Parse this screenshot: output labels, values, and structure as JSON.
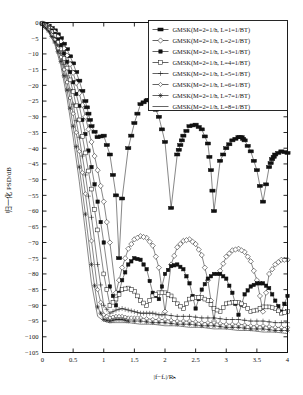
{
  "chart_data": {
    "type": "line",
    "title": "",
    "xlabel": "|f−f_c|/R_b",
    "ylabel": "归一化 PSD/dB",
    "xlim": [
      0,
      4
    ],
    "ylim": [
      -105,
      0
    ],
    "xticks": [
      "0",
      "0.5",
      "1",
      "1.5",
      "2",
      "2.5",
      "3",
      "3.5",
      "4"
    ],
    "xtick_values": [
      0,
      0.5,
      1,
      1.5,
      2,
      2.5,
      3,
      3.5,
      4
    ],
    "yticks": [
      "0",
      "−5",
      "−10",
      "−15",
      "−20",
      "−25",
      "−30",
      "−35",
      "−40",
      "−45",
      "−50",
      "−55",
      "−60",
      "−65",
      "−70",
      "−75",
      "−80",
      "−85",
      "−90",
      "−95",
      "−100",
      "−105"
    ],
    "ytick_values": [
      0,
      -5,
      -10,
      -15,
      -20,
      -25,
      -30,
      -35,
      -40,
      -45,
      -50,
      -55,
      -60,
      -65,
      -70,
      -75,
      -80,
      -85,
      -90,
      -95,
      -100,
      -105
    ],
    "grid": false,
    "legend_position": "top-right",
    "series": [
      {
        "name": "GMSK(M=2=1/h, L=1=1/BT)",
        "marker": "thick-bar",
        "x": [
          0,
          0.1,
          0.2,
          0.3,
          0.4,
          0.5,
          0.6,
          0.7,
          0.75,
          0.8,
          0.9,
          1.0,
          1.1,
          1.2,
          1.25,
          1.3,
          1.4,
          1.5,
          1.6,
          1.7,
          1.75,
          1.8,
          1.9,
          2.0,
          2.1,
          2.2,
          2.25,
          2.3,
          2.4,
          2.5,
          2.6,
          2.7,
          2.75,
          2.8,
          2.9,
          3.0,
          3.1,
          3.2,
          3.25,
          3.3,
          3.4,
          3.5,
          3.6,
          3.7,
          3.75,
          3.8,
          3.9,
          4.0
        ],
        "y": [
          -0.3,
          -1.0,
          -2.5,
          -5.0,
          -8.5,
          -13.0,
          -18.5,
          -25.0,
          -29.0,
          -33.0,
          -36.5,
          -36.0,
          -42.0,
          -55.0,
          -75.0,
          -56.0,
          -40.0,
          -32.0,
          -26.0,
          -24.8,
          -24.6,
          -25.5,
          -30.0,
          -38.0,
          -59.0,
          -42.0,
          -39.0,
          -36.0,
          -33.0,
          -32.5,
          -34.0,
          -38.5,
          -47.0,
          -60.0,
          -44.0,
          -40.0,
          -37.5,
          -36.5,
          -36.5,
          -37.5,
          -41.0,
          -47.0,
          -57.0,
          -46.0,
          -43.5,
          -42.0,
          -41.0,
          -41.5
        ]
      },
      {
        "name": "GMSK(M=2=1/h, L=2=1/BT)",
        "marker": "open-diamond",
        "x": [
          0,
          0.1,
          0.2,
          0.3,
          0.4,
          0.5,
          0.6,
          0.7,
          0.8,
          0.9,
          1.0,
          1.1,
          1.2,
          1.3,
          1.4,
          1.5,
          1.6,
          1.7,
          1.8,
          1.9,
          2.0,
          2.1,
          2.2,
          2.3,
          2.4,
          2.5,
          2.6,
          2.7,
          2.8,
          2.9,
          3.0,
          3.1,
          3.2,
          3.3,
          3.4,
          3.5,
          3.6,
          3.7,
          3.8,
          3.9,
          4.0
        ],
        "y": [
          -0.3,
          -1.2,
          -3.0,
          -6.0,
          -10.5,
          -16.0,
          -22.5,
          -30.0,
          -38.0,
          -47.0,
          -57.0,
          -70.0,
          -86.0,
          -78.0,
          -72.0,
          -69.0,
          -68.0,
          -68.5,
          -71.0,
          -78.0,
          -92.0,
          -77.0,
          -71.5,
          -69.5,
          -69.0,
          -70.5,
          -74.0,
          -82.0,
          -95.0,
          -79.0,
          -74.5,
          -72.5,
          -72.0,
          -73.0,
          -76.0,
          -82.0,
          -92.0,
          -80.0,
          -77.0,
          -75.5,
          -75.5
        ]
      },
      {
        "name": "GMSK(M=2=1/h, L=3=1/BT)",
        "marker": "filled-square",
        "x": [
          0,
          0.1,
          0.2,
          0.3,
          0.4,
          0.5,
          0.6,
          0.7,
          0.8,
          0.9,
          1.0,
          1.1,
          1.2,
          1.3,
          1.4,
          1.5,
          1.6,
          1.7,
          1.8,
          1.9,
          2.0,
          2.1,
          2.2,
          2.3,
          2.4,
          2.5,
          2.6,
          2.7,
          2.8,
          2.9,
          3.0,
          3.1,
          3.2,
          3.3,
          3.4,
          3.5,
          3.6,
          3.7,
          3.8,
          3.9,
          4.0
        ],
        "y": [
          -0.4,
          -1.5,
          -3.6,
          -7.2,
          -12.5,
          -19.0,
          -26.5,
          -35.5,
          -46.0,
          -57.0,
          -70.0,
          -84.0,
          -90.0,
          -82.0,
          -77.0,
          -75.0,
          -75.5,
          -78.5,
          -86.0,
          -88.0,
          -80.0,
          -77.5,
          -77.0,
          -78.5,
          -83.0,
          -91.0,
          -85.0,
          -81.5,
          -80.0,
          -80.0,
          -81.5,
          -86.0,
          -93.0,
          -86.5,
          -84.0,
          -83.0,
          -83.0,
          -84.5,
          -88.5,
          -92.0,
          -87.0
        ]
      },
      {
        "name": "GMSK(M=2=1/h, L=4=1/BT)",
        "marker": "open-square",
        "x": [
          0,
          0.1,
          0.2,
          0.3,
          0.4,
          0.5,
          0.6,
          0.7,
          0.8,
          0.9,
          1.0,
          1.1,
          1.2,
          1.3,
          1.4,
          1.5,
          1.6,
          1.7,
          1.8,
          1.9,
          2.0,
          2.1,
          2.2,
          2.3,
          2.4,
          2.5,
          2.6,
          2.7,
          2.8,
          2.9,
          3.0,
          3.1,
          3.2,
          3.3,
          3.4,
          3.5,
          3.6,
          3.7,
          3.8,
          3.9,
          4.0
        ],
        "y": [
          -0.4,
          -1.8,
          -4.2,
          -8.4,
          -14.5,
          -22.0,
          -31.0,
          -41.5,
          -53.0,
          -66.0,
          -80.0,
          -90.0,
          -88.0,
          -85.0,
          -84.5,
          -85.5,
          -88.5,
          -90.0,
          -87.0,
          -86.0,
          -86.0,
          -87.0,
          -89.5,
          -91.0,
          -88.0,
          -87.5,
          -87.5,
          -88.5,
          -91.0,
          -92.0,
          -89.5,
          -89.0,
          -89.0,
          -90.0,
          -92.0,
          -91.5,
          -90.5,
          -90.5,
          -91.0,
          -92.5,
          -92.0
        ]
      },
      {
        "name": "GMSK(M=2=1/h, L=5=1/BT)",
        "marker": "plus",
        "x": [
          0,
          0.1,
          0.2,
          0.3,
          0.4,
          0.5,
          0.6,
          0.7,
          0.8,
          0.9,
          1.0,
          1.1,
          1.2,
          1.3,
          1.4,
          1.5,
          1.6,
          1.7,
          1.8,
          1.9,
          2.0,
          2.2,
          2.4,
          2.6,
          2.8,
          3.0,
          3.2,
          3.4,
          3.6,
          3.8,
          4.0
        ],
        "y": [
          -0.5,
          -2.1,
          -4.9,
          -9.8,
          -17.0,
          -26.0,
          -36.5,
          -48.5,
          -62.0,
          -77.0,
          -90.0,
          -92.5,
          -91.5,
          -91.0,
          -91.5,
          -92.0,
          -92.5,
          -92.5,
          -92.5,
          -93.0,
          -93.0,
          -93.5,
          -93.5,
          -94.0,
          -94.0,
          -94.5,
          -94.5,
          -95.0,
          -95.0,
          -95.5,
          -95.5
        ]
      },
      {
        "name": "GMSK(M=2=1/h, L=6=1/BT)",
        "marker": "small-diamond",
        "x": [
          0,
          0.1,
          0.2,
          0.3,
          0.4,
          0.5,
          0.6,
          0.7,
          0.8,
          0.9,
          1.0,
          1.1,
          1.2,
          1.3,
          1.4,
          1.5,
          1.6,
          1.8,
          2.0,
          2.2,
          2.4,
          2.6,
          2.8,
          3.0,
          3.2,
          3.4,
          3.6,
          3.8,
          4.0
        ],
        "y": [
          -0.5,
          -2.4,
          -5.5,
          -11.0,
          -19.0,
          -29.0,
          -41.0,
          -54.5,
          -69.5,
          -85.0,
          -93.0,
          -94.0,
          -93.5,
          -93.5,
          -94.0,
          -94.0,
          -94.0,
          -94.5,
          -94.5,
          -95.0,
          -95.0,
          -95.5,
          -95.5,
          -96.0,
          -96.0,
          -96.5,
          -96.5,
          -97.0,
          -97.0
        ]
      },
      {
        "name": "GMSK(M=2=1/h, L=7=1/BT)",
        "marker": "star",
        "x": [
          0,
          0.1,
          0.2,
          0.3,
          0.4,
          0.5,
          0.6,
          0.7,
          0.8,
          0.9,
          1.0,
          1.1,
          1.2,
          1.3,
          1.4,
          1.6,
          1.8,
          2.0,
          2.2,
          2.4,
          2.6,
          2.8,
          3.0,
          3.2,
          3.4,
          3.6,
          3.8,
          4.0
        ],
        "y": [
          -0.6,
          -2.7,
          -6.2,
          -12.4,
          -21.5,
          -33.0,
          -46.0,
          -61.0,
          -77.0,
          -90.5,
          -94.5,
          -95.0,
          -94.5,
          -94.5,
          -95.0,
          -95.0,
          -95.5,
          -95.5,
          -96.0,
          -96.0,
          -96.5,
          -96.5,
          -97.0,
          -97.0,
          -97.5,
          -97.5,
          -98.0,
          -98.0
        ]
      },
      {
        "name": "GMSK(M=2=1/h, L=8=1/BT)",
        "marker": "none",
        "x": [
          0,
          0.1,
          0.2,
          0.3,
          0.4,
          0.5,
          0.6,
          0.7,
          0.8,
          0.9,
          1.0,
          1.1,
          1.2,
          1.4,
          1.6,
          1.8,
          2.0,
          2.2,
          2.4,
          2.6,
          2.8,
          3.0,
          3.2,
          3.4,
          3.6,
          3.8,
          4.0
        ],
        "y": [
          -0.6,
          -3.0,
          -6.9,
          -13.8,
          -24.0,
          -36.5,
          -50.5,
          -66.5,
          -83.0,
          -93.5,
          -95.0,
          -95.5,
          -95.5,
          -95.5,
          -96.0,
          -96.0,
          -96.5,
          -96.5,
          -97.0,
          -97.0,
          -97.5,
          -97.5,
          -98.0,
          -98.0,
          -98.5,
          -98.5,
          -99.0
        ]
      }
    ]
  },
  "legend": {
    "entries": [
      "GMSK(M=2=1/h, L=1=1/BT)",
      "GMSK(M=2=1/h, L=2=1/BT)",
      "GMSK(M=2=1/h, L=3=1/BT)",
      "GMSK(M=2=1/h, L=4=1/BT)",
      "GMSK(M=2=1/h, L=5=1/BT)",
      "GMSK(M=2=1/h, L=6=1/BT)",
      "GMSK(M=2=1/h, L=7=1/BT)",
      "GMSK(M=2=1/h, L=8=1/BT)"
    ]
  },
  "axes": {
    "xlabel": "|f−fₑ|/Rₕ",
    "ylabel": "归一化 PSD/dB"
  },
  "colors": {
    "line": "#222222",
    "frame": "#111111",
    "background": "#ffffff"
  }
}
